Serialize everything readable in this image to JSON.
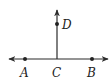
{
  "diagram": {
    "type": "geometry",
    "colors": {
      "stroke": "#2a2a2a",
      "point": "#222222",
      "label": "#222222"
    },
    "line_ab": {
      "x1": 9,
      "y1": 59,
      "x2": 108,
      "y2": 59,
      "arrows": "both"
    },
    "ray_cd": {
      "x1": 57,
      "y1": 59,
      "x2": 57,
      "y2": 10,
      "arrows": "end"
    },
    "points": [
      {
        "id": "A",
        "label": "A",
        "x": 25,
        "y": 59,
        "lx": 20,
        "ly": 77,
        "dot": true
      },
      {
        "id": "C",
        "label": "C",
        "x": 57,
        "y": 59,
        "lx": 52,
        "ly": 77,
        "dot": false
      },
      {
        "id": "B",
        "label": "B",
        "x": 92,
        "y": 59,
        "lx": 87,
        "ly": 77,
        "dot": true
      },
      {
        "id": "D",
        "label": "D",
        "x": 57,
        "y": 24,
        "lx": 62,
        "ly": 29,
        "dot": true
      }
    ]
  }
}
